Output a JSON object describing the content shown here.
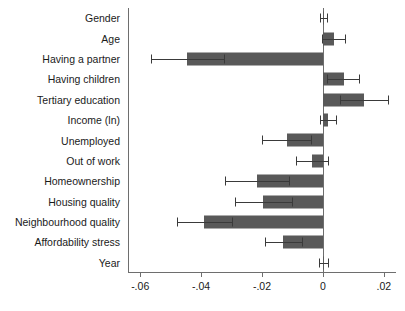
{
  "chart_data": {
    "type": "bar",
    "orientation": "horizontal",
    "title": "",
    "subtitle": "",
    "xlabel": "",
    "ylabel": "",
    "xlim": [
      -0.064,
      0.024
    ],
    "xticks": [
      -0.06,
      -0.04,
      -0.02,
      0,
      0.02
    ],
    "xtick_labels": [
      "-.06",
      "-.04",
      "-.02",
      "0",
      ".02"
    ],
    "grid": false,
    "legend": null,
    "zero_reference_line": 0,
    "error_bars": "95% confidence interval",
    "categories": [
      "Gender",
      "Age",
      "Having a partner",
      "Having children",
      "Tertiary education",
      "Income (ln)",
      "Unemployed",
      "Out of work",
      "Homeownership",
      "Housing quality",
      "Neighbourhood quality",
      "Affordability stress",
      "Year"
    ],
    "values": [
      0.0002,
      0.0035,
      -0.0445,
      0.0068,
      0.0135,
      0.0017,
      -0.0118,
      -0.0036,
      -0.0215,
      -0.0197,
      -0.039,
      -0.013,
      0.0002
    ],
    "ci_low": [
      -0.001,
      -0.0003,
      -0.0565,
      0.0012,
      0.0055,
      -0.0008,
      -0.02,
      -0.009,
      -0.032,
      -0.029,
      -0.048,
      -0.019,
      -0.0012
    ],
    "ci_high": [
      0.0014,
      0.0072,
      -0.0325,
      0.012,
      0.0215,
      0.0042,
      -0.004,
      0.0018,
      -0.0112,
      -0.0103,
      -0.03,
      -0.007,
      0.0016
    ],
    "series": [
      {
        "name": "Coefficient",
        "color": "#595959",
        "values": [
          0.0002,
          0.0035,
          -0.0445,
          0.0068,
          0.0135,
          0.0017,
          -0.0118,
          -0.0036,
          -0.0215,
          -0.0197,
          -0.039,
          -0.013,
          0.0002
        ]
      }
    ]
  },
  "style": {
    "bar_color": "#595959",
    "axis_color": "#6e6e6e",
    "error_bar_color": "#3a3a3a",
    "background": "#ffffff",
    "text_color": "#1a1a1a"
  }
}
